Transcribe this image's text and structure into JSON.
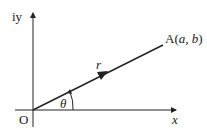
{
  "diagram": {
    "y_axis_label": "iy",
    "x_axis_label": "x",
    "origin_label": "O",
    "point_label_prefix": "A(",
    "point_a": "a",
    "point_sep": ", ",
    "point_b": "b",
    "point_label_suffix": ")",
    "vector_label": "r",
    "angle_label": "θ",
    "colors": {
      "stroke": "#222222",
      "background": "#ffffff"
    }
  }
}
